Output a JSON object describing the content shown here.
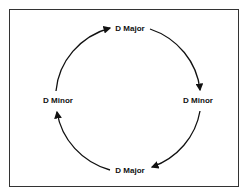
{
  "diagram": {
    "nodes": [
      {
        "id": "top",
        "label": "D Major"
      },
      {
        "id": "right",
        "label": "D Minor"
      },
      {
        "id": "bottom",
        "label": "D Major"
      },
      {
        "id": "left",
        "label": "D Minor"
      }
    ],
    "edges": [
      {
        "from": "top",
        "to": "right",
        "direction": "clockwise"
      },
      {
        "from": "right",
        "to": "bottom",
        "direction": "clockwise"
      },
      {
        "from": "bottom",
        "to": "left",
        "direction": "clockwise"
      },
      {
        "from": "left",
        "to": "top",
        "direction": "clockwise"
      }
    ],
    "colors": {
      "stroke": "#111111",
      "border": "#333333",
      "background": "#ffffff"
    }
  }
}
